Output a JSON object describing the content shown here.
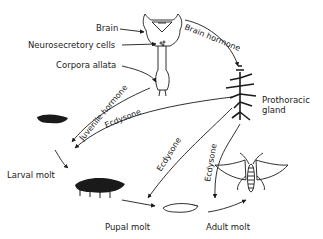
{
  "diagram": {
    "type": "insect hormonal control of molting",
    "labels": {
      "brain": "Brain",
      "neurosecretory_cells": "Neurosecretory cells",
      "corpora_allata": "Corpora allata",
      "brain_hormone": "Brain hormone",
      "prothoracic_gland_1": "Prothoracic",
      "prothoracic_gland_2": "gland",
      "juvenile_hormone": "Juvenile hormone",
      "ecdysone_1": "Ecdysone",
      "ecdysone_2": "Ecdysone",
      "ecdysone_3": "Ecdysone",
      "larval_molt": "Larval molt",
      "pupal_molt": "Pupal molt",
      "adult_molt": "Adult molt"
    },
    "stages": [
      "Larva (small)",
      "Larva (large)",
      "Pupa",
      "Adult moth"
    ],
    "colors": {
      "ink": "#1a1a1a",
      "background": "#ffffff"
    }
  }
}
